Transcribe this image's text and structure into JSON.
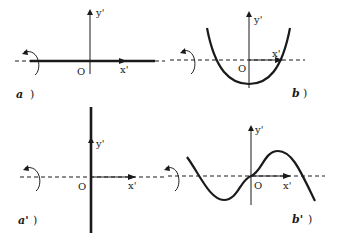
{
  "panels": {
    "a": {
      "label": "a",
      "origin": "O",
      "x_axis": "x'",
      "y_axis": "y'"
    },
    "b": {
      "label": "b",
      "origin": "O",
      "x_axis": "x'",
      "y_axis": "y'"
    },
    "a_prime": {
      "label": "a'",
      "origin": "O",
      "x_axis": "x'",
      "y_axis": "y'"
    },
    "b_prime": {
      "label": "b'",
      "origin": "O",
      "x_axis": "x'",
      "y_axis": "y'"
    }
  },
  "colors": {
    "ink": "#1a1a1a",
    "background": "#ffffff"
  }
}
